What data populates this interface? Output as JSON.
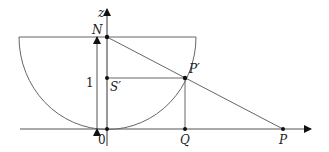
{
  "diagram": {
    "type": "stereographic-projection",
    "labels": {
      "z_axis": "z",
      "north": "N",
      "unit_length": "1",
      "s_prime": "S′",
      "p_prime": "P′",
      "origin": "0",
      "q": "Q",
      "p": "P"
    },
    "colors": {
      "stroke": "#555555",
      "text": "#222222",
      "background": "#ffffff"
    }
  }
}
